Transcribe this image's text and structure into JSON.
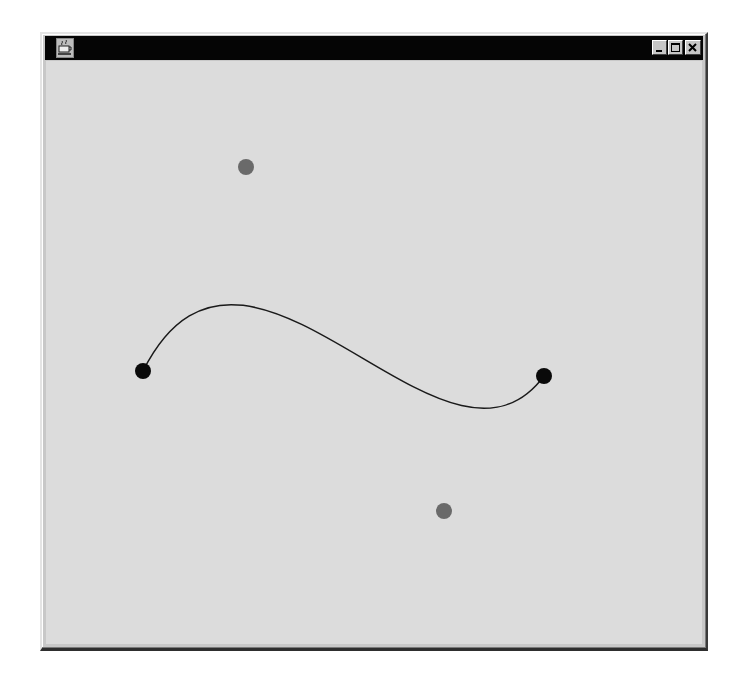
{
  "window": {
    "title": "",
    "icon": "java-coffee-cup-icon",
    "controls": {
      "minimize": "minimize-icon",
      "maximize": "maximize-icon",
      "close": "close-icon"
    }
  },
  "canvas": {
    "background": "#dcdcdc",
    "curve": {
      "type": "cubic-bezier",
      "stroke": "#1a1a1a",
      "stroke_width": 1.5,
      "start": {
        "x": 143,
        "y": 371
      },
      "control1": {
        "x": 246,
        "y": 167
      },
      "control2": {
        "x": 444,
        "y": 511
      },
      "end": {
        "x": 544,
        "y": 376
      }
    },
    "endpoints": {
      "color": "#0a0a0a",
      "radius": 8,
      "points": [
        {
          "name": "start-point",
          "x": 143,
          "y": 371
        },
        {
          "name": "end-point",
          "x": 544,
          "y": 376
        }
      ]
    },
    "control_points": {
      "color": "#6a6a6a",
      "radius": 8,
      "points": [
        {
          "name": "control-point-1",
          "x": 246,
          "y": 167
        },
        {
          "name": "control-point-2",
          "x": 444,
          "y": 511
        }
      ]
    }
  }
}
